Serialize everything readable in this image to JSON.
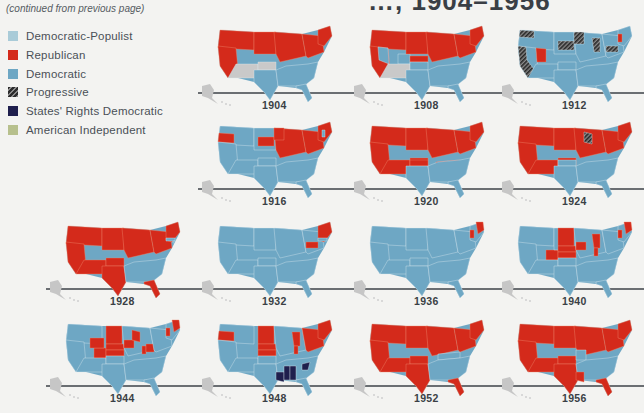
{
  "page": {
    "title_fragment": "…, 1904–1956",
    "continued_note": "(continued from previous page)"
  },
  "colors": {
    "democratic_populist": "#a9cbd8",
    "republican": "#d42a1b",
    "democratic": "#6ea7c4",
    "progressive": "hatched",
    "states_rights_democratic": "#1f1f4d",
    "american_independent": "#b7c08d",
    "not_state": "#c9c9c9",
    "border": "#f0d6c8",
    "axis": "#6a6e72"
  },
  "legend": [
    {
      "label": "Democratic-Populist",
      "color": "#a9cbd8",
      "key": "DP"
    },
    {
      "label": "Republican",
      "color": "#d42a1b",
      "key": "R"
    },
    {
      "label": "Democratic",
      "color": "#6ea7c4",
      "key": "D"
    },
    {
      "label": "Progressive",
      "color": "hatched",
      "key": "P"
    },
    {
      "label": "States' Rights Democratic",
      "color": "#1f1f4d",
      "key": "SRD"
    },
    {
      "label": "American Independent",
      "color": "#b7c08d",
      "key": "AI"
    }
  ],
  "maps": [
    {
      "year": "1904",
      "row": 0,
      "col": 1,
      "regions": {
        "northwest": "R",
        "west": "R",
        "southwest": "N",
        "plains_north": "R",
        "plains_south": "N",
        "texas": "D",
        "midwest": "R",
        "northeast": "R",
        "south": "D",
        "florida": "D",
        "new_england": "R"
      }
    },
    {
      "year": "1908",
      "row": 0,
      "col": 2,
      "regions": {
        "northwest": "R",
        "west": "R",
        "nevada": "D",
        "colorado": "D",
        "southwest": "N",
        "plains_north": "R",
        "plains_south": "D",
        "kansas": "R",
        "texas": "D",
        "midwest": "R",
        "northeast": "R",
        "south": "D",
        "florida": "D",
        "new_england": "R"
      }
    },
    {
      "year": "1912",
      "row": 0,
      "col": 3,
      "regions": {
        "northwest": "D",
        "washington": "P",
        "california": "P",
        "utah": "R",
        "west": "D",
        "southwest": "D",
        "plains_north": "D",
        "south_dakota": "P",
        "minnesota": "P",
        "michigan": "P",
        "pennsylvania": "P",
        "vermont": "R",
        "plains_south": "D",
        "texas": "D",
        "midwest": "D",
        "northeast": "D",
        "south": "D",
        "florida": "D",
        "new_england": "D"
      }
    },
    {
      "year": "1916",
      "row": 1,
      "col": 1,
      "regions": {
        "northwest": "D",
        "oregon": "R",
        "west": "D",
        "southwest": "D",
        "plains_north": "D",
        "south_dakota": "R",
        "minnesota": "R",
        "plains_south": "D",
        "texas": "D",
        "midwest": "R",
        "northeast": "R",
        "south": "D",
        "florida": "D",
        "new_england": "R",
        "new_hampshire": "D"
      }
    },
    {
      "year": "1920",
      "row": 1,
      "col": 2,
      "regions": {
        "northwest": "R",
        "west": "R",
        "southwest": "R",
        "plains_north": "R",
        "plains_south": "R",
        "oklahoma": "R",
        "tennessee": "R",
        "texas": "D",
        "midwest": "R",
        "northeast": "R",
        "south": "D",
        "florida": "D",
        "new_england": "R"
      }
    },
    {
      "year": "1924",
      "row": 1,
      "col": 3,
      "regions": {
        "northwest": "R",
        "west": "R",
        "southwest": "R",
        "plains_north": "R",
        "wisconsin": "P",
        "plains_south": "R",
        "texas": "D",
        "oklahoma": "D",
        "midwest": "R",
        "northeast": "R",
        "south": "D",
        "florida": "D",
        "new_england": "R"
      }
    },
    {
      "year": "1928",
      "row": 2,
      "col": 0,
      "regions": {
        "northwest": "R",
        "west": "R",
        "southwest": "R",
        "plains_north": "R",
        "plains_south": "R",
        "texas": "R",
        "midwest": "R",
        "northeast": "R",
        "south": "D",
        "florida": "R",
        "massachusetts": "D",
        "rhode_island": "D",
        "new_england": "R"
      }
    },
    {
      "year": "1932",
      "row": 2,
      "col": 1,
      "regions": {
        "northwest": "D",
        "west": "D",
        "southwest": "D",
        "plains_north": "D",
        "plains_south": "D",
        "texas": "D",
        "midwest": "D",
        "pennsylvania": "R",
        "northeast": "D",
        "south": "D",
        "florida": "D",
        "new_england": "R",
        "massachusetts": "D"
      }
    },
    {
      "year": "1936",
      "row": 2,
      "col": 2,
      "regions": {
        "northwest": "D",
        "west": "D",
        "southwest": "D",
        "plains_north": "D",
        "plains_south": "D",
        "texas": "D",
        "midwest": "D",
        "northeast": "D",
        "south": "D",
        "florida": "D",
        "maine": "R",
        "vermont": "R",
        "new_england": "D"
      }
    },
    {
      "year": "1940",
      "row": 2,
      "col": 3,
      "regions": {
        "northwest": "D",
        "west": "D",
        "southwest": "D",
        "plains_north": "D",
        "dakotas": "R",
        "nebraska": "R",
        "kansas": "R",
        "colorado": "R",
        "iowa": "R",
        "michigan": "R",
        "indiana": "R",
        "plains_south": "D",
        "texas": "D",
        "midwest": "D",
        "northeast": "D",
        "south": "D",
        "florida": "D",
        "maine": "R",
        "vermont": "R",
        "new_england": "D"
      }
    },
    {
      "year": "1944",
      "row": 3,
      "col": 0,
      "regions": {
        "northwest": "D",
        "west": "D",
        "wyoming": "R",
        "colorado": "R",
        "dakotas": "R",
        "nebraska": "R",
        "kansas": "R",
        "iowa": "R",
        "wisconsin": "R",
        "ohio": "R",
        "indiana": "R",
        "southwest": "D",
        "plains_south": "D",
        "texas": "D",
        "midwest": "D",
        "northeast": "D",
        "south": "D",
        "florida": "D",
        "maine": "R",
        "vermont": "R",
        "new_england": "D"
      }
    },
    {
      "year": "1948",
      "row": 3,
      "col": 1,
      "regions": {
        "northwest": "D",
        "oregon": "R",
        "west": "D",
        "dakotas": "R",
        "nebraska": "R",
        "kansas": "R",
        "michigan": "R",
        "indiana": "R",
        "northeast": "R",
        "new_england": "R",
        "louisiana": "SRD",
        "mississippi": "SRD",
        "alabama": "SRD",
        "south_carolina": "SRD",
        "southwest": "D",
        "plains_south": "D",
        "texas": "D",
        "midwest": "D",
        "south": "D",
        "florida": "D"
      }
    },
    {
      "year": "1952",
      "row": 3,
      "col": 2,
      "regions": {
        "northwest": "R",
        "west": "R",
        "southwest": "R",
        "plains_north": "R",
        "plains_south": "R",
        "texas": "R",
        "midwest": "R",
        "northeast": "R",
        "south": "D",
        "kentucky": "D",
        "florida": "R",
        "new_england": "R"
      }
    },
    {
      "year": "1956",
      "row": 3,
      "col": 3,
      "regions": {
        "northwest": "R",
        "west": "R",
        "southwest": "R",
        "plains_north": "R",
        "plains_south": "R",
        "texas": "R",
        "louisiana": "R",
        "missouri": "D",
        "midwest": "R",
        "northeast": "R",
        "south": "D",
        "florida": "R",
        "new_england": "R"
      }
    }
  ]
}
